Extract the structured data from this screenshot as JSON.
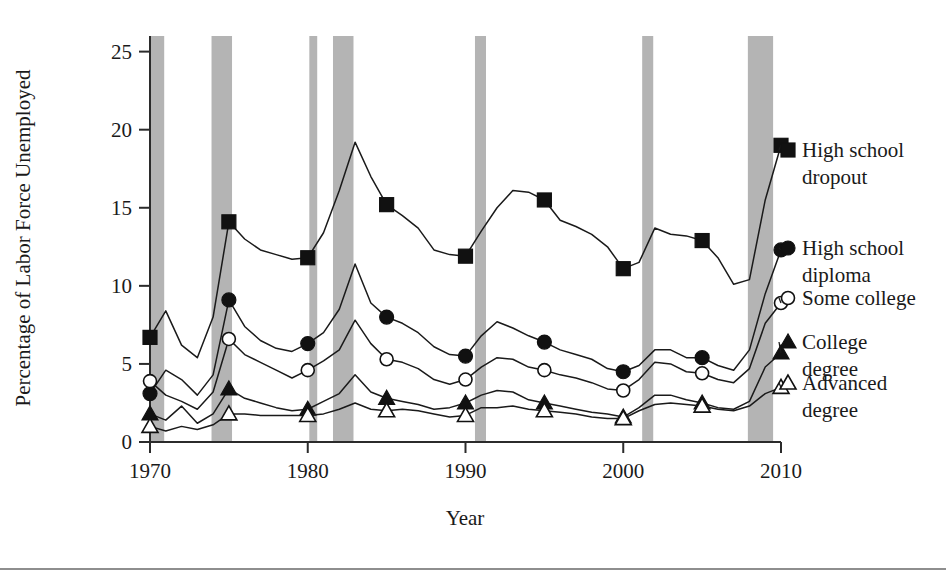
{
  "chart_data": {
    "type": "line",
    "title": "",
    "xlabel": "Year",
    "ylabel": "Percentage of Labor Force Unemployed",
    "xlim": [
      1970,
      2010
    ],
    "ylim": [
      0,
      26
    ],
    "xticks": [
      1970,
      1980,
      1990,
      2000,
      2010
    ],
    "xtick_labels": [
      "1970",
      "1980",
      "1990",
      "2000",
      "2010"
    ],
    "yticks": [
      0,
      5,
      10,
      15,
      20,
      25
    ],
    "ytick_labels": [
      "0",
      "5",
      "10",
      "15",
      "20",
      "25"
    ],
    "grid": false,
    "legend_position": "right-of-plot",
    "shaded_regions_label": "recession bands",
    "shaded_regions": [
      {
        "start": 1970.0,
        "end": 1970.9
      },
      {
        "start": 1973.9,
        "end": 1975.2
      },
      {
        "start": 1980.1,
        "end": 1980.6
      },
      {
        "start": 1981.6,
        "end": 1982.9
      },
      {
        "start": 1990.6,
        "end": 1991.3
      },
      {
        "start": 2001.2,
        "end": 2001.9
      },
      {
        "start": 2007.9,
        "end": 2009.5
      }
    ],
    "x": [
      1970,
      1971,
      1972,
      1973,
      1974,
      1975,
      1976,
      1977,
      1978,
      1979,
      1980,
      1981,
      1982,
      1983,
      1984,
      1985,
      1986,
      1987,
      1988,
      1989,
      1990,
      1991,
      1992,
      1993,
      1994,
      1995,
      1996,
      1997,
      1998,
      1999,
      2000,
      2001,
      2002,
      2003,
      2004,
      2005,
      2006,
      2007,
      2008,
      2009,
      2010
    ],
    "series": [
      {
        "name": "High school dropout",
        "marker": "filled-square",
        "marker_years": [
          1970,
          1975,
          1980,
          1985,
          1990,
          1995,
          2000,
          2005,
          2010
        ],
        "values": [
          6.7,
          8.4,
          6.2,
          5.4,
          8.0,
          14.1,
          13.0,
          12.3,
          12.0,
          11.7,
          11.8,
          13.4,
          16.1,
          19.2,
          17.0,
          15.2,
          14.5,
          13.7,
          12.3,
          12.0,
          11.9,
          13.5,
          15.0,
          16.1,
          16.0,
          15.5,
          14.2,
          13.8,
          13.3,
          12.5,
          11.1,
          11.5,
          13.7,
          13.3,
          13.2,
          12.9,
          11.8,
          10.1,
          10.4,
          15.5,
          19.0
        ]
      },
      {
        "name": "High school diploma",
        "marker": "filled-circle",
        "marker_years": [
          1970,
          1975,
          1980,
          1985,
          1990,
          1995,
          2000,
          2005,
          2010
        ],
        "values": [
          3.1,
          4.6,
          4.0,
          3.0,
          4.3,
          9.1,
          7.4,
          6.5,
          6.0,
          5.8,
          6.3,
          7.0,
          8.5,
          11.4,
          8.9,
          8.0,
          7.6,
          7.0,
          6.1,
          5.6,
          5.5,
          6.8,
          7.7,
          7.3,
          6.8,
          6.4,
          5.9,
          5.6,
          5.3,
          4.7,
          4.5,
          4.9,
          5.9,
          5.9,
          5.4,
          5.4,
          4.9,
          4.6,
          5.9,
          9.5,
          12.3
        ]
      },
      {
        "name": "Some college",
        "marker": "open-circle",
        "marker_years": [
          1970,
          1975,
          1980,
          1985,
          1990,
          1995,
          2000,
          2005,
          2010
        ],
        "values": [
          3.9,
          3.0,
          2.6,
          2.1,
          3.2,
          6.6,
          5.6,
          5.1,
          4.6,
          4.1,
          4.6,
          5.2,
          5.9,
          7.8,
          6.3,
          5.3,
          5.1,
          4.7,
          4.0,
          3.7,
          4.0,
          4.8,
          5.4,
          5.3,
          4.8,
          4.6,
          4.3,
          4.1,
          3.8,
          3.4,
          3.3,
          4.0,
          5.1,
          5.0,
          4.5,
          4.4,
          4.0,
          3.8,
          4.7,
          7.6,
          8.9
        ]
      },
      {
        "name": "College degree",
        "marker": "filled-triangle",
        "marker_years": [
          1970,
          1975,
          1980,
          1985,
          1990,
          1995,
          2000,
          2005,
          2010
        ],
        "values": [
          1.8,
          1.4,
          2.3,
          1.2,
          1.8,
          3.4,
          2.8,
          2.5,
          2.2,
          2.0,
          2.1,
          2.6,
          3.1,
          4.3,
          3.2,
          2.8,
          2.6,
          2.4,
          2.1,
          2.2,
          2.5,
          3.0,
          3.3,
          3.2,
          2.7,
          2.5,
          2.3,
          2.1,
          1.9,
          1.8,
          1.6,
          2.2,
          3.0,
          3.0,
          2.7,
          2.5,
          2.2,
          2.1,
          2.6,
          4.8,
          5.7
        ]
      },
      {
        "name": "Advanced degree",
        "marker": "open-triangle",
        "marker_years": [
          1970,
          1975,
          1980,
          1985,
          1990,
          1995,
          2000,
          2005,
          2010
        ],
        "values": [
          1.0,
          0.7,
          1.0,
          0.8,
          1.1,
          1.8,
          1.8,
          1.7,
          1.7,
          1.7,
          1.7,
          1.8,
          2.1,
          2.5,
          2.1,
          2.0,
          2.1,
          2.0,
          1.8,
          1.6,
          1.7,
          2.2,
          2.2,
          2.3,
          2.1,
          2.0,
          1.9,
          1.8,
          1.6,
          1.5,
          1.5,
          2.0,
          2.4,
          2.5,
          2.4,
          2.3,
          2.1,
          2.0,
          2.3,
          3.1,
          3.5
        ]
      }
    ]
  },
  "legend": {
    "entries": [
      {
        "label_line1": "High school",
        "label_line2": "dropout"
      },
      {
        "label_line1": "High school",
        "label_line2": "diploma"
      },
      {
        "label_line1": "Some college",
        "label_line2": ""
      },
      {
        "label_line1": "College",
        "label_line2": "degree"
      },
      {
        "label_line1": "Advanced",
        "label_line2": "degree"
      }
    ]
  },
  "colors": {
    "band": "#b4b4b4",
    "ink": "#1a1a1a",
    "axis": "#2b2b2b"
  }
}
